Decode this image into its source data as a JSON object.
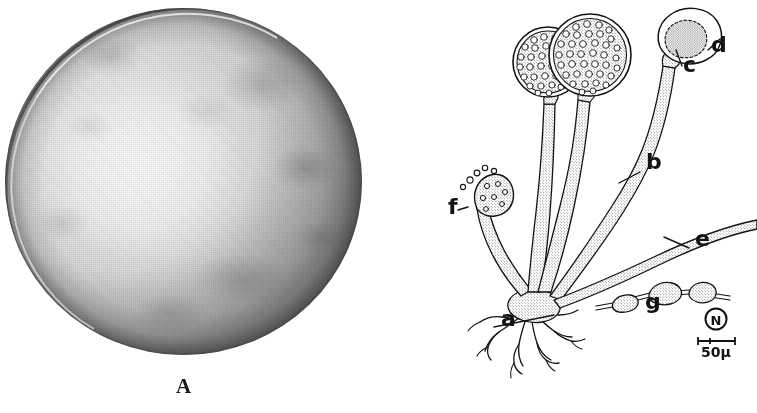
{
  "figure": {
    "background_color": "#ffffff",
    "ink_color": "#111315",
    "panels": [
      {
        "letter": "A",
        "name": "petri-dish-photograph",
        "kind": "halftone photograph",
        "subject": "culture plate colony",
        "tones": {
          "centre_highlight": "#f2f2f2",
          "mid_agar": "#d8d8d8",
          "shadow_edge": "#a6a6a6",
          "rim_dark": "#282828"
        }
      },
      {
        "letter": "B",
        "name": "fungus-line-drawing",
        "kind": "pen and ink line drawing",
        "subject": "sporangiophores, sporangia, stolon and rhizoids"
      }
    ]
  },
  "panel_b": {
    "labels": [
      {
        "key": "a",
        "text": "a",
        "part": "rhizoids",
        "x": 123,
        "y": 326
      },
      {
        "key": "b",
        "text": "b",
        "part": "sporangiophore",
        "x": 268,
        "y": 169
      },
      {
        "key": "c",
        "text": "c",
        "part": "columella",
        "x": 305,
        "y": 72
      },
      {
        "key": "d",
        "text": "d",
        "part": "sporangial wall",
        "x": 333,
        "y": 52
      },
      {
        "key": "e",
        "text": "e",
        "part": "stolon",
        "x": 317,
        "y": 246
      },
      {
        "key": "f",
        "text": "f",
        "part": "young sporangium shedding spores",
        "x": 70,
        "y": 214
      },
      {
        "key": "g",
        "text": "g",
        "part": "chlamydospores in hypha",
        "x": 267,
        "y": 309
      }
    ],
    "scale_bar": {
      "label": "50μ",
      "monogram": "N",
      "monogram_shape": "circled-letter"
    }
  }
}
